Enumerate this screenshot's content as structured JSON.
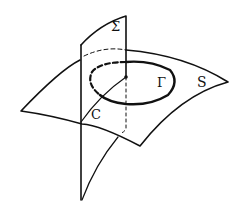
{
  "figure": {
    "labels": {
      "sigma": "Σ",
      "gamma": "Γ",
      "surface": "S",
      "curve": "C"
    },
    "colors": {
      "stroke": "#111111",
      "background": "#ffffff"
    }
  }
}
